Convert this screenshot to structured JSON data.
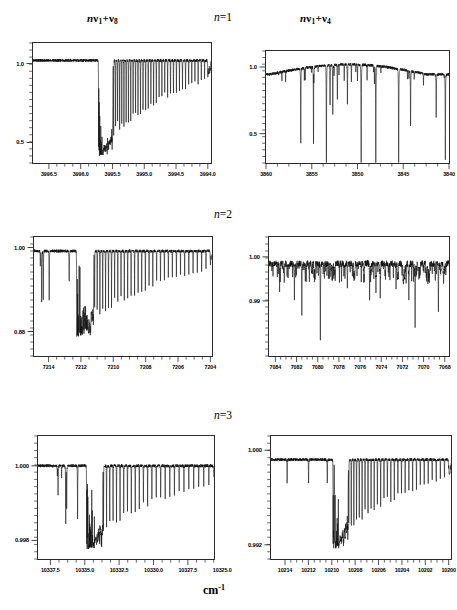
{
  "figure": {
    "x_axis_unit": "cm",
    "x_axis_unit_exponent": "-1",
    "column_titles": [
      {
        "id": "left",
        "prefix": "n",
        "nu1": "ν",
        "sub1": "1",
        "plus": "+",
        "nu2": "ν",
        "sub2": "8",
        "text": "nν1+ν8"
      },
      {
        "id": "right",
        "prefix": "n",
        "nu1": "ν",
        "sub1": "1",
        "plus": "+",
        "nu2": "ν",
        "sub2": "4",
        "text": "nν1+ν4"
      }
    ],
    "row_labels": [
      {
        "var": "n",
        "eq": "=1"
      },
      {
        "var": "n",
        "eq": "=2"
      },
      {
        "var": "n",
        "eq": "=3"
      }
    ],
    "line_color": "#111111",
    "frame_color": "#2b2b2b"
  },
  "chart_data": [
    {
      "id": "n1-left",
      "type": "line",
      "title": "nν1+ν8",
      "row": "n=1",
      "xlabel": "cm-1",
      "ylabel": "",
      "xlim": [
        3996.75,
        3993.95
      ],
      "ylim": [
        0.37,
        1.13
      ],
      "x_ticks": [
        3996.5,
        3996.0,
        3995.5,
        3995.0,
        3994.5,
        3994.0
      ],
      "x_tick_labels": [
        "3996.5",
        "3996.0",
        "3995.5",
        "3995.0",
        "3994.5",
        "3994.0"
      ],
      "y_ticks": [
        1.0,
        0.5
      ],
      "y_tick_labels": [
        "1.0",
        "0.5"
      ],
      "baseline": 1.02,
      "band_head": 3995.72,
      "band_tail": 3994.0,
      "comb_count": 46,
      "depth_max": 0.4,
      "grid": false,
      "legend": null,
      "description": "Flat baseline at 1.0 until band head near 3995.72, then dense progression of sharp absorption lines recovering toward 1.0 at low wavenumber."
    },
    {
      "id": "n1-right",
      "type": "line",
      "title": "nν1+ν4",
      "row": "n=1",
      "xlabel": "cm-1",
      "ylabel": "",
      "xlim": [
        3860.0,
        3840.0
      ],
      "ylim": [
        0.28,
        1.12
      ],
      "x_ticks": [
        3860,
        3855,
        3850,
        3845,
        3840
      ],
      "x_tick_labels": [
        "3860",
        "3855",
        "3850",
        "3845",
        "3840"
      ],
      "y_ticks": [
        1.0,
        0.5
      ],
      "y_tick_labels": [
        "1.0",
        "0.5"
      ],
      "baseline": 1.0,
      "grid": false,
      "legend": null,
      "description": "Gently arched continuum near 1.0 with scattered deep isolated absorption lines, deepest near 3853-3852 and 3841.",
      "lines": [
        {
          "x": 3856.2,
          "depth": 0.42
        },
        {
          "x": 3854.8,
          "depth": 0.1
        },
        {
          "x": 3853.4,
          "depth": 0.22
        },
        {
          "x": 3853.0,
          "depth": 0.7
        },
        {
          "x": 3852.7,
          "depth": 0.64
        },
        {
          "x": 3852.2,
          "depth": 0.74
        },
        {
          "x": 3851.1,
          "depth": 0.72
        },
        {
          "x": 3849.6,
          "depth": 0.14
        },
        {
          "x": 3848.0,
          "depth": 0.08
        },
        {
          "x": 3845.5,
          "depth": 0.12
        },
        {
          "x": 3844.2,
          "depth": 0.55
        },
        {
          "x": 3841.4,
          "depth": 0.62
        },
        {
          "x": 3840.4,
          "depth": 0.3
        }
      ]
    },
    {
      "id": "n2-left",
      "type": "line",
      "title": "nν1+ν8",
      "row": "n=2",
      "xlabel": "cm-1",
      "ylabel": "",
      "xlim": [
        7214.9,
        7203.9
      ],
      "ylim": [
        0.845,
        1.015
      ],
      "x_ticks": [
        7214,
        7212,
        7210,
        7208,
        7206,
        7204
      ],
      "x_tick_labels": [
        "7214",
        "7212",
        "7210",
        "7208",
        "7206",
        "7204"
      ],
      "y_ticks": [
        1.0,
        0.88
      ],
      "y_tick_labels": [
        "1.00",
        "0.88"
      ],
      "baseline": 0.995,
      "band_head": 7212.3,
      "band_tail": 7204.0,
      "comb_count": 42,
      "depth_max": 0.87,
      "grid": false,
      "legend": null,
      "description": "Noisy baseline just below 1.00 with sparse lines above 7212, then a dense saturated band head at 7212.3 falling to ~0.87, with progressively weaker lines toward 7204."
    },
    {
      "id": "n2-right",
      "type": "line",
      "title": "nν1+ν4",
      "row": "n=2",
      "xlabel": "cm-1",
      "ylabel": "",
      "xlim": [
        7084.6,
        7067.6
      ],
      "ylim": [
        0.9775,
        1.0045
      ],
      "x_ticks": [
        7084,
        7082,
        7080,
        7078,
        7076,
        7074,
        7072,
        7070,
        7068
      ],
      "x_tick_labels": [
        "7084",
        "7082",
        "7080",
        "7078",
        "7076",
        "7074",
        "7072",
        "7070",
        "7068"
      ],
      "y_ticks": [
        1.0,
        0.99
      ],
      "y_tick_labels": [
        "1.00",
        "0.99"
      ],
      "baseline": 0.9985,
      "grid": false,
      "legend": null,
      "description": "Very noisy trace near 1.00 with many narrow absorption lines; the deepest spikes occur near 7079.7 and 7071.4.",
      "lines": [
        {
          "x": 7083.6,
          "depth": 0.992
        },
        {
          "x": 7082.2,
          "depth": 0.9895
        },
        {
          "x": 7081.5,
          "depth": 0.9865
        },
        {
          "x": 7079.75,
          "depth": 0.9805
        },
        {
          "x": 7078.4,
          "depth": 0.9945
        },
        {
          "x": 7077.2,
          "depth": 0.9925
        },
        {
          "x": 7076.5,
          "depth": 0.9935
        },
        {
          "x": 7075.1,
          "depth": 0.9895
        },
        {
          "x": 7074.5,
          "depth": 0.9905
        },
        {
          "x": 7074.1,
          "depth": 0.9855
        },
        {
          "x": 7072.6,
          "depth": 0.9925
        },
        {
          "x": 7071.9,
          "depth": 0.9895
        },
        {
          "x": 7071.4,
          "depth": 0.9795
        },
        {
          "x": 7070.8,
          "depth": 0.9835
        },
        {
          "x": 7069.6,
          "depth": 0.9915
        },
        {
          "x": 7068.6,
          "depth": 0.9875
        },
        {
          "x": 7068.1,
          "depth": 0.9855
        }
      ]
    },
    {
      "id": "n3-left",
      "type": "line",
      "title": "nν1+ν8",
      "row": "n=3",
      "xlabel": "cm-1",
      "ylabel": "",
      "xlim": [
        10338.4,
        10325.6
      ],
      "ylim": [
        0.9975,
        1.0008
      ],
      "x_ticks": [
        10337.5,
        10335.0,
        10332.5,
        10330.0,
        10327.5,
        10325.0
      ],
      "x_tick_labels": [
        "10337.5",
        "10335.0",
        "10332.5",
        "10330.0",
        "10327.5",
        "10325.0"
      ],
      "y_ticks": [
        1.0,
        0.998
      ],
      "y_tick_labels": [
        "1.000",
        "0.998"
      ],
      "baseline": 1.0,
      "band_head": 10334.9,
      "band_tail": 10325.6,
      "comb_count": 34,
      "depth_max": 0.9977,
      "grid": false,
      "legend": null,
      "description": "Weak noisy baseline at 1.000 with a few isolated lines before the band head at 10334.9; dense sharp comb of lines reaching 0.998 then weakening toward 10325."
    },
    {
      "id": "n3-right",
      "type": "line",
      "title": "nν1+ν4",
      "row": "n=3",
      "xlabel": "cm-1",
      "ylabel": "",
      "xlim": [
        10215.2,
        10199.8
      ],
      "ylim": [
        0.9908,
        1.0012
      ],
      "x_ticks": [
        10214,
        10212,
        10210,
        10208,
        10206,
        10204,
        10202,
        10200
      ],
      "x_tick_labels": [
        "10214",
        "10212",
        "10210",
        "10208",
        "10206",
        "10204",
        "10202",
        "10200"
      ],
      "y_ticks": [
        1.0,
        0.992
      ],
      "y_tick_labels": [
        "1.000",
        "0.992"
      ],
      "baseline": 0.9992,
      "band_head": 10209.9,
      "band_tail": 10200.0,
      "comb_count": 38,
      "depth_max": 0.9915,
      "grid": false,
      "legend": null,
      "description": "Flat noisy baseline near 1.000 with one strong line at ~10210.5, then a dense saturated band head at 10209.9 descending to ~0.9915 and recovering toward 10200."
    }
  ]
}
